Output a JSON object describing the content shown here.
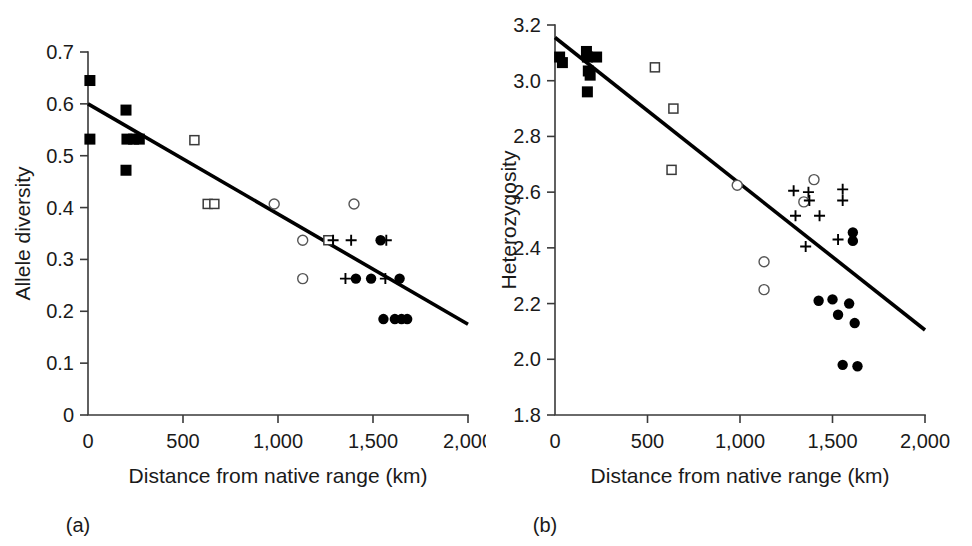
{
  "figure": {
    "background": "#ffffff",
    "line_color": "#000000",
    "axis_color": "#3a3a3a"
  },
  "panels": [
    {
      "key": "a",
      "label": "(a)",
      "chart_data": {
        "type": "scatter",
        "title": "",
        "xlabel": "Distance from native range (km)",
        "ylabel": "Allele diversity",
        "xlim": [
          0,
          2000
        ],
        "ylim": [
          0,
          0.7
        ],
        "xticks": [
          0,
          500,
          1000,
          1500,
          2000
        ],
        "xticklabels": [
          "0",
          "500",
          "1,000",
          "1,500",
          "2,000"
        ],
        "yticks": [
          0,
          0.1,
          0.2,
          0.3,
          0.4,
          0.5,
          0.6,
          0.7
        ],
        "yticklabels": [
          "0",
          "0.1",
          "0.2",
          "0.3",
          "0.4",
          "0.5",
          "0.6",
          "0.7"
        ],
        "grid": false,
        "legend": "none",
        "trendline": {
          "name": "linear fit",
          "x": [
            0,
            2000
          ],
          "y": [
            0.6,
            0.175
          ]
        },
        "series": [
          {
            "name": "filled squares",
            "marker": "filled-square",
            "points": [
              [
                10,
                0.645
              ],
              [
                10,
                0.532
              ],
              [
                200,
                0.588
              ],
              [
                200,
                0.472
              ],
              [
                205,
                0.532
              ],
              [
                240,
                0.532
              ],
              [
                270,
                0.532
              ]
            ]
          },
          {
            "name": "open squares",
            "marker": "open-square",
            "points": [
              [
                560,
                0.53
              ],
              [
                630,
                0.407
              ],
              [
                665,
                0.407
              ],
              [
                1265,
                0.337
              ]
            ]
          },
          {
            "name": "open circles",
            "marker": "open-circle",
            "points": [
              [
                980,
                0.407
              ],
              [
                1400,
                0.407
              ],
              [
                1130,
                0.337
              ],
              [
                1130,
                0.263
              ]
            ]
          },
          {
            "name": "plus markers",
            "marker": "plus",
            "points": [
              [
                1290,
                0.337
              ],
              [
                1385,
                0.337
              ],
              [
                1570,
                0.337
              ],
              [
                1355,
                0.263
              ],
              [
                1565,
                0.263
              ]
            ]
          },
          {
            "name": "filled circles",
            "marker": "filled-circle",
            "points": [
              [
                1540,
                0.337
              ],
              [
                1410,
                0.263
              ],
              [
                1490,
                0.263
              ],
              [
                1640,
                0.263
              ],
              [
                1555,
                0.185
              ],
              [
                1615,
                0.185
              ],
              [
                1650,
                0.185
              ],
              [
                1680,
                0.185
              ]
            ]
          }
        ]
      }
    },
    {
      "key": "b",
      "label": "(b)",
      "chart_data": {
        "type": "scatter",
        "title": "",
        "xlabel": "Distance from native range (km)",
        "ylabel": "Heterozygosity",
        "xlim": [
          0,
          2000
        ],
        "ylim": [
          1.8,
          3.2
        ],
        "xticks": [
          0,
          500,
          1000,
          1500,
          2000
        ],
        "xticklabels": [
          "0",
          "500",
          "1,000",
          "1,500",
          "2,000"
        ],
        "yticks": [
          1.8,
          2.0,
          2.2,
          2.4,
          2.6,
          2.8,
          3.0,
          3.2
        ],
        "yticklabels": [
          "1.8",
          "2.0",
          "2.2",
          "2.4",
          "2.6",
          "2.8",
          "3.0",
          "3.2"
        ],
        "grid": false,
        "legend": "none",
        "trendline": {
          "name": "linear fit",
          "x": [
            0,
            2000
          ],
          "y": [
            3.155,
            2.105
          ]
        },
        "series": [
          {
            "name": "filled squares",
            "marker": "filled-square",
            "points": [
              [
                25,
                3.085
              ],
              [
                40,
                3.065
              ],
              [
                170,
                3.105
              ],
              [
                175,
                3.085
              ],
              [
                225,
                3.085
              ],
              [
                180,
                3.035
              ],
              [
                190,
                3.02
              ],
              [
                175,
                2.96
              ]
            ]
          },
          {
            "name": "open squares",
            "marker": "open-square",
            "points": [
              [
                540,
                3.048
              ],
              [
                640,
                2.9
              ],
              [
                630,
                2.68
              ]
            ]
          },
          {
            "name": "open circles",
            "marker": "open-circle",
            "points": [
              [
                985,
                2.625
              ],
              [
                1345,
                2.565
              ],
              [
                1400,
                2.645
              ],
              [
                1130,
                2.35
              ],
              [
                1130,
                2.25
              ]
            ]
          },
          {
            "name": "plus markers",
            "marker": "plus",
            "points": [
              [
                1290,
                2.605
              ],
              [
                1370,
                2.6
              ],
              [
                1375,
                2.57
              ],
              [
                1555,
                2.61
              ],
              [
                1555,
                2.57
              ],
              [
                1300,
                2.515
              ],
              [
                1430,
                2.515
              ],
              [
                1355,
                2.405
              ],
              [
                1530,
                2.43
              ]
            ]
          },
          {
            "name": "filled circles",
            "marker": "filled-circle",
            "points": [
              [
                1610,
                2.455
              ],
              [
                1610,
                2.425
              ],
              [
                1425,
                2.21
              ],
              [
                1500,
                2.215
              ],
              [
                1590,
                2.2
              ],
              [
                1530,
                2.16
              ],
              [
                1620,
                2.13
              ],
              [
                1555,
                1.98
              ],
              [
                1635,
                1.975
              ]
            ]
          }
        ]
      }
    }
  ]
}
